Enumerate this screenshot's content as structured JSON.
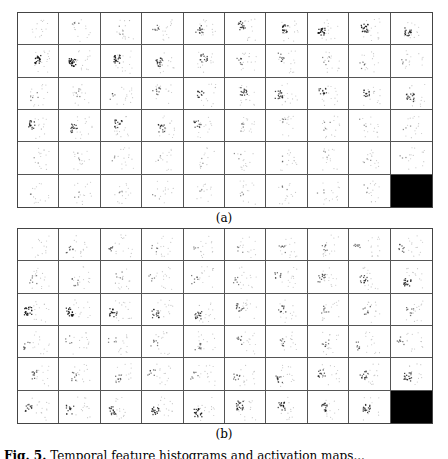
{
  "figure": {
    "panels": [
      {
        "id": "a",
        "label": "(a)",
        "rows": 6,
        "cols": 10,
        "description": "Grid of activation map thumbnails; final cell is solid black",
        "intensity": [
          [
            0.0,
            0.15,
            0.15,
            0.3,
            0.5,
            0.6,
            0.7,
            0.85,
            0.8,
            0.7
          ],
          [
            0.85,
            0.95,
            0.8,
            0.65,
            0.55,
            0.3,
            0.35,
            0.2,
            0.2,
            0.15
          ],
          [
            0.2,
            0.2,
            0.2,
            0.35,
            0.5,
            0.6,
            0.65,
            0.55,
            0.55,
            0.6
          ],
          [
            0.65,
            0.6,
            0.6,
            0.55,
            0.45,
            0.2,
            0.15,
            0.15,
            0.1,
            0.1
          ],
          [
            0.08,
            0.1,
            0.1,
            0.08,
            0.08,
            0.1,
            0.1,
            0.1,
            0.1,
            0.1
          ],
          [
            0.08,
            0.1,
            0.1,
            0.08,
            0.08,
            0.1,
            0.1,
            0.1,
            0.1,
            "black"
          ]
        ]
      },
      {
        "id": "b",
        "label": "(b)",
        "rows": 6,
        "cols": 10,
        "description": "Grid of activation map thumbnails; final cell is solid black",
        "intensity": [
          [
            0.0,
            0.3,
            0.3,
            0.2,
            0.15,
            0.15,
            0.25,
            0.25,
            0.3,
            0.35
          ],
          [
            0.25,
            0.25,
            0.2,
            0.2,
            0.25,
            0.25,
            0.35,
            0.45,
            0.55,
            0.7
          ],
          [
            0.85,
            0.8,
            0.7,
            0.6,
            0.6,
            0.45,
            0.4,
            0.3,
            0.3,
            0.3
          ],
          [
            0.3,
            0.2,
            0.2,
            0.25,
            0.3,
            0.3,
            0.3,
            0.3,
            0.3,
            0.3
          ],
          [
            0.4,
            0.3,
            0.35,
            0.3,
            0.25,
            0.35,
            0.45,
            0.5,
            0.55,
            0.65
          ],
          [
            0.5,
            0.55,
            0.6,
            0.7,
            0.75,
            0.7,
            0.65,
            0.6,
            0.65,
            "black"
          ]
        ]
      }
    ],
    "caption": {
      "prefix": "Fig. 5.",
      "text": "Temporal feature histograms and activation maps..."
    }
  }
}
